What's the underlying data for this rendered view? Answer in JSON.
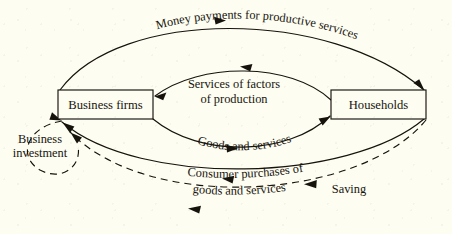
{
  "figure": {
    "type": "circular-flow-diagram",
    "background_color": "#fdfdf1",
    "ink_color": "#16130d"
  },
  "nodes": {
    "business_firms": {
      "label": "Business firms",
      "x": 58,
      "y": 90,
      "width": 95,
      "height": 29
    },
    "households": {
      "label": "Households",
      "x": 331,
      "y": 90,
      "width": 95,
      "height": 29
    }
  },
  "flows": {
    "money_payments": {
      "label": "Money payments for productive services",
      "style": "solid",
      "direction": "business-firms-to-households"
    },
    "services_of_factors": {
      "label_line1": "Services of factors",
      "label_line2": "of production",
      "style": "solid",
      "direction": "households-to-business-firms"
    },
    "goods_and_services": {
      "label": "Goods and services",
      "style": "solid",
      "direction": "business-firms-to-households"
    },
    "consumer_purchases": {
      "label_line1": "Consumer purchases of",
      "label_line2": "goods and services",
      "style": "solid",
      "direction": "households-to-business-firms"
    },
    "saving": {
      "label": "Saving",
      "style": "dashed",
      "direction": "households-to-business-investment"
    },
    "business_investment": {
      "label_line1": "Business",
      "label_line2": "investment",
      "style": "dashed",
      "direction": "loop-into-business-firms"
    }
  }
}
